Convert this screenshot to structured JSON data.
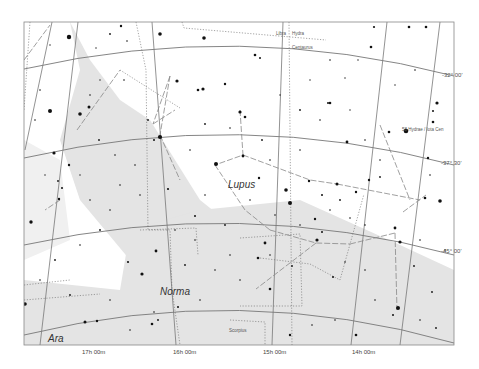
{
  "map": {
    "frame": {
      "x": 24,
      "y": 22,
      "w": 430,
      "h": 323
    },
    "background": "#ffffff",
    "milky_way_color": "#e4e4e4",
    "milky_way_light": "#f0f0f0",
    "grid_color": "#777777",
    "boundary_color": "#666666",
    "figure_color": "#888888",
    "star_color": "#111111"
  },
  "constellations": [
    {
      "name": "Lupus",
      "x": 228,
      "y": 180
    },
    {
      "name": "Norma",
      "x": 160,
      "y": 287
    },
    {
      "name": "Ara",
      "x": 48,
      "y": 334
    }
  ],
  "neighbor_labels": [
    {
      "text": "Libra",
      "x": 276,
      "y": 32
    },
    {
      "text": "Hydra",
      "x": 292,
      "y": 32
    },
    {
      "text": "Centaurus",
      "x": 292,
      "y": 46
    },
    {
      "text": "Scorpius",
      "x": 229,
      "y": 329
    }
  ],
  "ra_labels": [
    {
      "text": "17h 00m",
      "x": 82,
      "y": 349
    },
    {
      "text": "16h 00m",
      "x": 173,
      "y": 349
    },
    {
      "text": "15h 00m",
      "x": 263,
      "y": 349
    },
    {
      "text": "14h 00m",
      "x": 352,
      "y": 349
    }
  ],
  "dec_labels": [
    {
      "text": "-32° 00'",
      "x": 442,
      "y": 72
    },
    {
      "text": "-37° 30'",
      "x": 441,
      "y": 160
    },
    {
      "text": "-45° 00'",
      "x": 441,
      "y": 248
    }
  ],
  "named_stars": [
    {
      "text": "58 Hydrae / Iota Cen",
      "x": 402,
      "y": 128
    }
  ],
  "dec_lines": [
    "M24,69 Q240,20 454,76",
    "M24,158 Q240,108 454,165",
    "M24,245 Q240,197 454,255",
    "M24,335 Q240,282 454,343"
  ],
  "ra_lines": [
    "M52,22 L25,150",
    "M78,22 L40,345",
    "M152,22 L176,345",
    "M283,22 L272,345",
    "M387,22 L351,345",
    "M440,22 L400,345"
  ],
  "boundaries": [
    "M30,22 L24,110",
    "M136,22 L146,70 L148,230 L170,230 L172,290 L180,345",
    "M182,22 L184,28 L326,40",
    "M289,22 L292,345",
    "M120,70 L180,108",
    "M140,230 L196,228 L198,255",
    "M240,238 L300,234 L302,306 L240,306",
    "M230,320 L265,322 L265,345",
    "M260,258 L310,264 L340,280 L364,194",
    "M24,285 L70,280",
    "M24,300 L100,294"
  ],
  "figure_lines": [
    "M170,76 L153,124",
    "M170,76 L160,135",
    "M160,135 L180,180",
    "M153,124 L175,110",
    "M240,110 L243,155 L215,165",
    "M243,155 L310,180 L337,184",
    "M215,165 L245,210 L270,230",
    "M270,230 L316,243 L350,244",
    "M316,243 L256,289",
    "M350,244 L395,233",
    "M337,184 L420,200",
    "M395,233 L397,310",
    "M403,212 L426,195",
    "M77,130 L120,70",
    "M60,200 L45,210",
    "M24,60 L50,25",
    "M380,125 L410,200"
  ],
  "milky_way_polys": [
    "M24,22 L70,22 L80,70 L60,140 L80,200 L130,260 L190,330 L330,330 L310,300 L250,240 L200,200 L150,120 L120,100 L90,60 L70,22 Z",
    "M24,140 L60,160 L70,240 L24,260 Z",
    "M130,230 L200,210 L300,200 L400,245 L454,270 L454,345 L24,345 L24,280 L120,290 Z"
  ],
  "stars": [
    {
      "x": 69,
      "y": 37,
      "r": 2.2
    },
    {
      "x": 121,
      "y": 26,
      "r": 1.2
    },
    {
      "x": 160,
      "y": 34,
      "r": 1.8
    },
    {
      "x": 204,
      "y": 38,
      "r": 1.8
    },
    {
      "x": 110,
      "y": 34,
      "r": 0.9
    },
    {
      "x": 127,
      "y": 41,
      "r": 0.8
    },
    {
      "x": 50,
      "y": 45,
      "r": 0.7
    },
    {
      "x": 96,
      "y": 48,
      "r": 0.7
    },
    {
      "x": 177,
      "y": 81,
      "r": 1.6
    },
    {
      "x": 198,
      "y": 90,
      "r": 1.3
    },
    {
      "x": 203,
      "y": 89,
      "r": 1.6
    },
    {
      "x": 225,
      "y": 84,
      "r": 1.2
    },
    {
      "x": 50,
      "y": 111,
      "r": 2.0
    },
    {
      "x": 89,
      "y": 107,
      "r": 1.5
    },
    {
      "x": 80,
      "y": 114,
      "r": 1.8
    },
    {
      "x": 124,
      "y": 80,
      "r": 0.8
    },
    {
      "x": 54,
      "y": 153,
      "r": 1.6
    },
    {
      "x": 160,
      "y": 137,
      "r": 2.1
    },
    {
      "x": 154,
      "y": 140,
      "r": 1.0
    },
    {
      "x": 148,
      "y": 120,
      "r": 0.9
    },
    {
      "x": 240,
      "y": 112,
      "r": 1.6
    },
    {
      "x": 245,
      "y": 117,
      "r": 1.3
    },
    {
      "x": 216,
      "y": 164,
      "r": 2.0
    },
    {
      "x": 243,
      "y": 156,
      "r": 1.4
    },
    {
      "x": 259,
      "y": 178,
      "r": 1.2
    },
    {
      "x": 286,
      "y": 190,
      "r": 1.8
    },
    {
      "x": 290,
      "y": 203,
      "r": 2.0
    },
    {
      "x": 309,
      "y": 181,
      "r": 1.2
    },
    {
      "x": 337,
      "y": 184,
      "r": 1.5
    },
    {
      "x": 356,
      "y": 192,
      "r": 1.2
    },
    {
      "x": 369,
      "y": 180,
      "r": 1.2
    },
    {
      "x": 380,
      "y": 177,
      "r": 0.9
    },
    {
      "x": 255,
      "y": 55,
      "r": 1.3
    },
    {
      "x": 260,
      "y": 58,
      "r": 1.0
    },
    {
      "x": 330,
      "y": 103,
      "r": 1.3
    },
    {
      "x": 328,
      "y": 103,
      "r": 1.0
    },
    {
      "x": 371,
      "y": 47,
      "r": 1.3
    },
    {
      "x": 437,
      "y": 103,
      "r": 1.6
    },
    {
      "x": 433,
      "y": 122,
      "r": 1.3
    },
    {
      "x": 406,
      "y": 131,
      "r": 2.3
    },
    {
      "x": 374,
      "y": 27,
      "r": 1.1
    },
    {
      "x": 409,
      "y": 27,
      "r": 1.3
    },
    {
      "x": 426,
      "y": 27,
      "r": 1.3
    },
    {
      "x": 347,
      "y": 142,
      "r": 1.4
    },
    {
      "x": 389,
      "y": 132,
      "r": 1.3
    },
    {
      "x": 433,
      "y": 111,
      "r": 1.0
    },
    {
      "x": 428,
      "y": 158,
      "r": 1.2
    },
    {
      "x": 440,
      "y": 201,
      "r": 1.8
    },
    {
      "x": 425,
      "y": 198,
      "r": 1.3
    },
    {
      "x": 395,
      "y": 228,
      "r": 1.4
    },
    {
      "x": 400,
      "y": 242,
      "r": 1.6
    },
    {
      "x": 398,
      "y": 308,
      "r": 2.0
    },
    {
      "x": 393,
      "y": 315,
      "r": 1.0
    },
    {
      "x": 414,
      "y": 266,
      "r": 0.9
    },
    {
      "x": 432,
      "y": 292,
      "r": 0.9
    },
    {
      "x": 315,
      "y": 219,
      "r": 1.2
    },
    {
      "x": 322,
      "y": 232,
      "r": 1.0
    },
    {
      "x": 270,
      "y": 289,
      "r": 1.3
    },
    {
      "x": 317,
      "y": 240,
      "r": 1.6
    },
    {
      "x": 265,
      "y": 243,
      "r": 1.4
    },
    {
      "x": 258,
      "y": 258,
      "r": 1.3
    },
    {
      "x": 292,
      "y": 266,
      "r": 0.9
    },
    {
      "x": 333,
      "y": 277,
      "r": 1.0
    },
    {
      "x": 356,
      "y": 335,
      "r": 1.3
    },
    {
      "x": 156,
      "y": 251,
      "r": 1.4
    },
    {
      "x": 142,
      "y": 274,
      "r": 1.6
    },
    {
      "x": 97,
      "y": 321,
      "r": 1.2
    },
    {
      "x": 85,
      "y": 322,
      "r": 1.5
    },
    {
      "x": 25,
      "y": 304,
      "r": 1.8
    },
    {
      "x": 31,
      "y": 222,
      "r": 1.7
    },
    {
      "x": 59,
      "y": 199,
      "r": 1.2
    },
    {
      "x": 62,
      "y": 188,
      "r": 1.0
    },
    {
      "x": 152,
      "y": 324,
      "r": 1.3
    },
    {
      "x": 158,
      "y": 320,
      "r": 0.9
    },
    {
      "x": 128,
      "y": 262,
      "r": 1.1
    },
    {
      "x": 168,
      "y": 189,
      "r": 1.1
    },
    {
      "x": 195,
      "y": 216,
      "r": 1.0
    },
    {
      "x": 178,
      "y": 307,
      "r": 1.0
    },
    {
      "x": 154,
      "y": 312,
      "r": 0.8
    },
    {
      "x": 69,
      "y": 165,
      "r": 1.2
    },
    {
      "x": 58,
      "y": 181,
      "r": 0.9
    },
    {
      "x": 99,
      "y": 140,
      "r": 0.9
    },
    {
      "x": 115,
      "y": 155,
      "r": 0.8
    },
    {
      "x": 135,
      "y": 165,
      "r": 0.8
    },
    {
      "x": 190,
      "y": 150,
      "r": 0.8
    },
    {
      "x": 205,
      "y": 124,
      "r": 0.9
    },
    {
      "x": 230,
      "y": 128,
      "r": 0.8
    },
    {
      "x": 262,
      "y": 140,
      "r": 0.9
    },
    {
      "x": 270,
      "y": 160,
      "r": 0.8
    },
    {
      "x": 300,
      "y": 150,
      "r": 0.8
    },
    {
      "x": 320,
      "y": 120,
      "r": 0.8
    },
    {
      "x": 350,
      "y": 110,
      "r": 0.7
    },
    {
      "x": 365,
      "y": 140,
      "r": 0.8
    },
    {
      "x": 380,
      "y": 160,
      "r": 0.8
    },
    {
      "x": 300,
      "y": 110,
      "r": 0.9
    },
    {
      "x": 280,
      "y": 95,
      "r": 0.7
    },
    {
      "x": 310,
      "y": 80,
      "r": 0.7
    },
    {
      "x": 345,
      "y": 78,
      "r": 0.7
    },
    {
      "x": 395,
      "y": 85,
      "r": 0.7
    },
    {
      "x": 415,
      "y": 70,
      "r": 0.8
    },
    {
      "x": 330,
      "y": 60,
      "r": 0.8
    },
    {
      "x": 358,
      "y": 60,
      "r": 0.7
    },
    {
      "x": 100,
      "y": 80,
      "r": 0.7
    },
    {
      "x": 90,
      "y": 95,
      "r": 0.8
    },
    {
      "x": 40,
      "y": 90,
      "r": 0.8
    },
    {
      "x": 35,
      "y": 120,
      "r": 0.8
    },
    {
      "x": 45,
      "y": 175,
      "r": 0.7
    },
    {
      "x": 90,
      "y": 200,
      "r": 0.8
    },
    {
      "x": 110,
      "y": 210,
      "r": 0.8
    },
    {
      "x": 100,
      "y": 230,
      "r": 0.9
    },
    {
      "x": 80,
      "y": 245,
      "r": 0.8
    },
    {
      "x": 55,
      "y": 260,
      "r": 0.9
    },
    {
      "x": 40,
      "y": 280,
      "r": 0.8
    },
    {
      "x": 70,
      "y": 295,
      "r": 0.9
    },
    {
      "x": 110,
      "y": 300,
      "r": 0.8
    },
    {
      "x": 130,
      "y": 330,
      "r": 0.8
    },
    {
      "x": 200,
      "y": 300,
      "r": 0.8
    },
    {
      "x": 215,
      "y": 270,
      "r": 0.8
    },
    {
      "x": 230,
      "y": 255,
      "r": 0.8
    },
    {
      "x": 225,
      "y": 225,
      "r": 0.9
    },
    {
      "x": 250,
      "y": 200,
      "r": 0.8
    },
    {
      "x": 275,
      "y": 215,
      "r": 0.8
    },
    {
      "x": 300,
      "y": 225,
      "r": 0.8
    },
    {
      "x": 330,
      "y": 210,
      "r": 0.8
    },
    {
      "x": 345,
      "y": 262,
      "r": 0.8
    },
    {
      "x": 365,
      "y": 270,
      "r": 0.8
    },
    {
      "x": 375,
      "y": 300,
      "r": 0.8
    },
    {
      "x": 420,
      "y": 320,
      "r": 0.8
    },
    {
      "x": 436,
      "y": 328,
      "r": 0.9
    },
    {
      "x": 445,
      "y": 250,
      "r": 0.8
    },
    {
      "x": 420,
      "y": 240,
      "r": 0.8
    },
    {
      "x": 430,
      "y": 175,
      "r": 0.8
    },
    {
      "x": 312,
      "y": 325,
      "r": 0.8
    },
    {
      "x": 290,
      "y": 335,
      "r": 1.2
    },
    {
      "x": 335,
      "y": 320,
      "r": 0.8
    },
    {
      "x": 185,
      "y": 265,
      "r": 0.9
    },
    {
      "x": 240,
      "y": 280,
      "r": 0.8
    },
    {
      "x": 120,
      "y": 185,
      "r": 0.8
    },
    {
      "x": 140,
      "y": 195,
      "r": 0.8
    },
    {
      "x": 80,
      "y": 175,
      "r": 0.7
    },
    {
      "x": 175,
      "y": 230,
      "r": 0.8
    },
    {
      "x": 195,
      "y": 240,
      "r": 0.8
    },
    {
      "x": 205,
      "y": 195,
      "r": 0.8
    },
    {
      "x": 270,
      "y": 255,
      "r": 0.8
    },
    {
      "x": 322,
      "y": 195,
      "r": 1.0
    },
    {
      "x": 340,
      "y": 200,
      "r": 0.9
    },
    {
      "x": 350,
      "y": 218,
      "r": 0.8
    },
    {
      "x": 365,
      "y": 225,
      "r": 0.8
    }
  ]
}
